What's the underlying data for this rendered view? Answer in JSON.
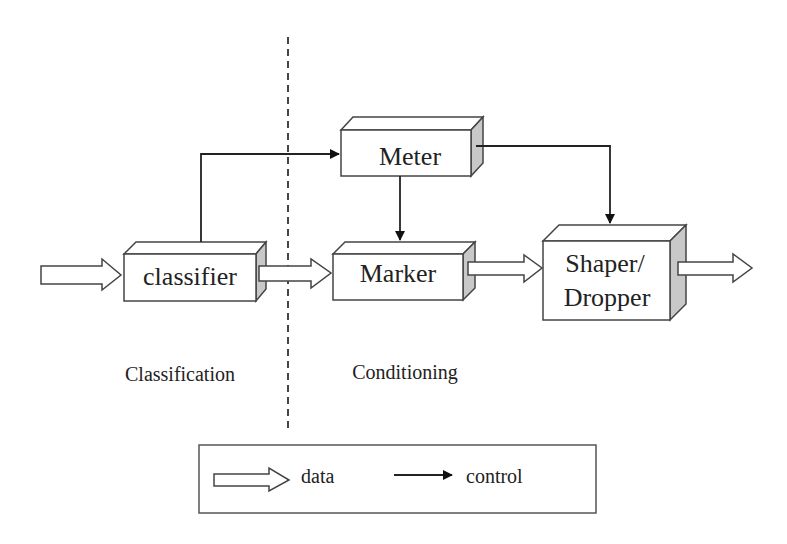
{
  "blocks": {
    "classifier": {
      "label": "classifier"
    },
    "meter": {
      "label": "Meter"
    },
    "marker": {
      "label": "Marker"
    },
    "shaper": {
      "line1": "Shaper/",
      "line2": "Dropper"
    }
  },
  "regions": {
    "left": "Classification",
    "right": "Conditioning"
  },
  "legend": {
    "data_label": "data",
    "control_label": "control"
  },
  "colors": {
    "stroke": "#333333",
    "side_face": "#c8c8c8",
    "background": "#ffffff"
  }
}
